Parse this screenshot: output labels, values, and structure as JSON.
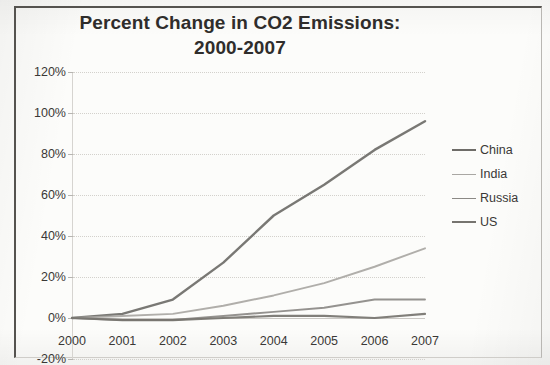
{
  "chart_data": {
    "type": "line",
    "title": "Percent Change in CO2 Emissions:",
    "title_line2": "2000-2007",
    "xlabel": "",
    "ylabel": "",
    "x": [
      2000,
      2001,
      2002,
      2003,
      2004,
      2005,
      2006,
      2007
    ],
    "categories": [
      "2000",
      "2001",
      "2002",
      "2003",
      "2004",
      "2005",
      "2006",
      "2007"
    ],
    "ylim": [
      -20,
      120
    ],
    "xlim": [
      2000,
      2007
    ],
    "ytick_labels": [
      "120%",
      "100%",
      "80%",
      "60%",
      "40%",
      "20%",
      "0%",
      "-20%"
    ],
    "ytick_values": [
      120,
      100,
      80,
      60,
      40,
      20,
      0,
      -20
    ],
    "ytick_step": 20,
    "y_unit": "%",
    "grid": true,
    "grid_axis": "y",
    "legend_position": "right",
    "series": [
      {
        "name": "China",
        "color": "#6e6c68",
        "width": 2.4,
        "values": [
          0,
          2,
          9,
          27,
          50,
          65,
          82,
          96
        ]
      },
      {
        "name": "India",
        "color": "#a9a7a3",
        "width": 1.9,
        "values": [
          0,
          1,
          2,
          6,
          11,
          17,
          25,
          34
        ]
      },
      {
        "name": "Russia",
        "color": "#8b8985",
        "width": 1.9,
        "values": [
          0,
          -1,
          -1,
          1,
          3,
          5,
          9,
          9
        ]
      },
      {
        "name": "US",
        "color": "#76746f",
        "width": 2.2,
        "values": [
          0,
          -1,
          -1,
          0,
          1,
          1,
          0,
          2
        ]
      }
    ]
  },
  "legend": {
    "entries": [
      "China",
      "India",
      "Russia",
      "US"
    ]
  },
  "colors": {
    "frame": "#55534f",
    "text": "#3a3836",
    "title": "#2f2d2b",
    "grid": "#cfcdc8",
    "paper": "#fcfcfa"
  }
}
